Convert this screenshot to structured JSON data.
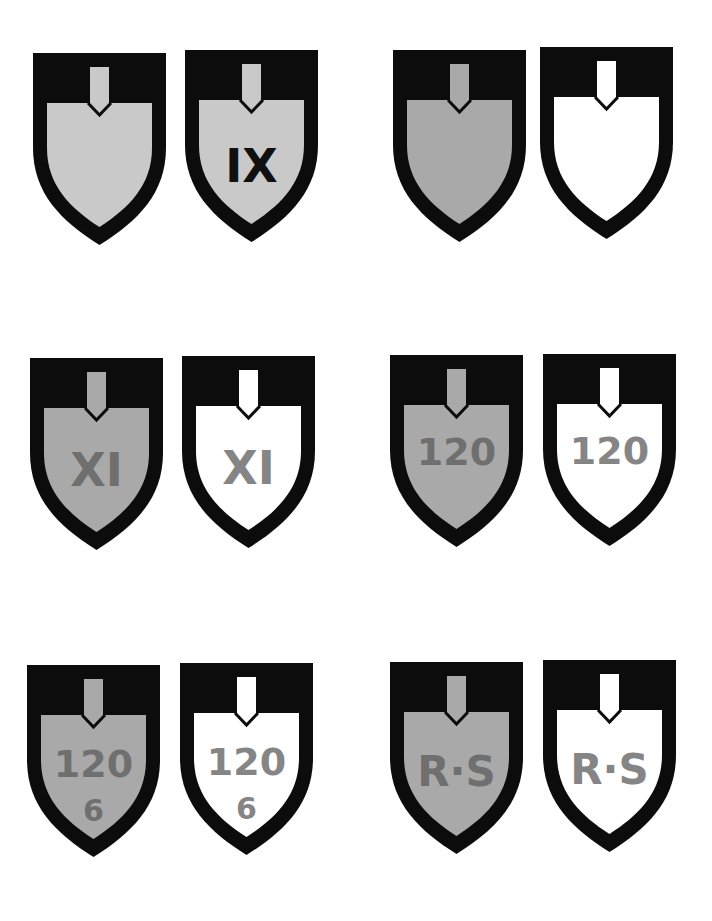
{
  "page": {
    "background": "#ffffff"
  },
  "colors": {
    "frame": "#0c0c0c",
    "light_gray_fill": "#c9c9c9",
    "mid_gray_fill": "#a9a9a9",
    "white_fill": "#ffffff",
    "black_text": "#101010",
    "gray_text_on_gray": "#6f6f6f",
    "gray_text_on_white": "#858585"
  },
  "badges": [
    {
      "id": "b1",
      "row": 1,
      "col": 1,
      "x": 33,
      "y": 53,
      "fill": "#c9c9c9",
      "text_lines": [],
      "text_color": ""
    },
    {
      "id": "b2",
      "row": 1,
      "col": 2,
      "x": 185,
      "y": 50,
      "fill": "#c9c9c9",
      "text_lines": [
        "IX"
      ],
      "text_color": "#101010"
    },
    {
      "id": "b3",
      "row": 1,
      "col": 3,
      "x": 393,
      "y": 50,
      "fill": "#a9a9a9",
      "text_lines": [],
      "text_color": ""
    },
    {
      "id": "b4",
      "row": 1,
      "col": 4,
      "x": 540,
      "y": 47,
      "fill": "#ffffff",
      "text_lines": [],
      "text_color": ""
    },
    {
      "id": "b5",
      "row": 2,
      "col": 1,
      "x": 30,
      "y": 358,
      "fill": "#a9a9a9",
      "text_lines": [
        "XI"
      ],
      "text_color": "#6f6f6f"
    },
    {
      "id": "b6",
      "row": 2,
      "col": 2,
      "x": 182,
      "y": 356,
      "fill": "#ffffff",
      "text_lines": [
        "XI"
      ],
      "text_color": "#858585"
    },
    {
      "id": "b7",
      "row": 2,
      "col": 3,
      "x": 390,
      "y": 355,
      "fill": "#a9a9a9",
      "text_lines": [
        "120"
      ],
      "text_color": "#6f6f6f"
    },
    {
      "id": "b8",
      "row": 2,
      "col": 4,
      "x": 543,
      "y": 354,
      "fill": "#ffffff",
      "text_lines": [
        "120"
      ],
      "text_color": "#858585"
    },
    {
      "id": "b9",
      "row": 3,
      "col": 1,
      "x": 27,
      "y": 665,
      "fill": "#a9a9a9",
      "text_lines": [
        "120",
        "6"
      ],
      "text_color": "#6f6f6f"
    },
    {
      "id": "b10",
      "row": 3,
      "col": 2,
      "x": 180,
      "y": 663,
      "fill": "#ffffff",
      "text_lines": [
        "120",
        "6"
      ],
      "text_color": "#858585"
    },
    {
      "id": "b11",
      "row": 3,
      "col": 3,
      "x": 390,
      "y": 662,
      "fill": "#a9a9a9",
      "text_lines": [
        "R·S"
      ],
      "text_color": "#6f6f6f"
    },
    {
      "id": "b12",
      "row": 3,
      "col": 4,
      "x": 543,
      "y": 660,
      "fill": "#ffffff",
      "text_lines": [
        "R·S"
      ],
      "text_color": "#858585"
    }
  ],
  "labels": {
    "b2": {
      "line1": "IX"
    },
    "b5": {
      "line1": "XI"
    },
    "b6": {
      "line1": "XI"
    },
    "b7": {
      "line1": "120"
    },
    "b8": {
      "line1": "120"
    },
    "b9": {
      "line1": "120",
      "line2": "6"
    },
    "b10": {
      "line1": "120",
      "line2": "6"
    },
    "b11": {
      "line1": "R·S"
    },
    "b12": {
      "line1": "R·S"
    }
  }
}
